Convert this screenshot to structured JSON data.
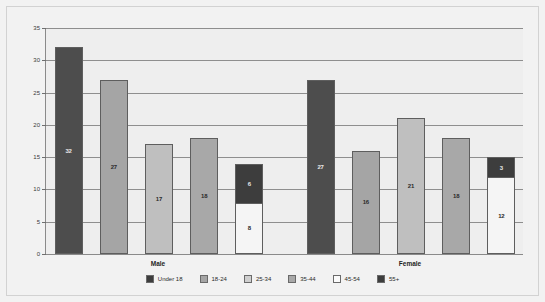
{
  "chart_data": {
    "type": "bar",
    "title": "",
    "subtitle": "",
    "xlabel": "",
    "ylabel": "",
    "grid": true,
    "legend_position": "bottom",
    "ylim": [
      0,
      35
    ],
    "yticks": [
      0,
      5,
      10,
      15,
      20,
      25,
      30,
      35
    ],
    "ytick_labels": [
      "0",
      "5",
      "10",
      "15",
      "20",
      "25",
      "30",
      "35"
    ],
    "categories": [
      "Male",
      "Female"
    ],
    "series": [
      {
        "name": "Under 18",
        "color": "#4d4d4d",
        "values": [
          32,
          27
        ]
      },
      {
        "name": "18-24",
        "color": "#a5a5a5",
        "values": [
          27,
          16
        ]
      },
      {
        "name": "25-34",
        "color": "#bfbfbf",
        "values": [
          17,
          21
        ]
      },
      {
        "name": "35-44",
        "color": "#a8a8a8",
        "values": [
          18,
          18
        ]
      },
      {
        "name": "45-54",
        "color": "#f5f5f5",
        "values": [
          8,
          12
        ]
      },
      {
        "name": "55+",
        "color": "#3d3d3d",
        "values": [
          6,
          3
        ]
      }
    ],
    "bars": [
      {
        "group": "Male",
        "index": 0,
        "segments": [
          {
            "series": "Under 18",
            "value": 32,
            "label": "32",
            "color": "#4d4d4d",
            "label_on": "dark"
          }
        ]
      },
      {
        "group": "Male",
        "index": 1,
        "segments": [
          {
            "series": "18-24",
            "value": 27,
            "label": "27",
            "color": "#a5a5a5",
            "label_on": "light"
          }
        ]
      },
      {
        "group": "Male",
        "index": 2,
        "segments": [
          {
            "series": "25-34",
            "value": 17,
            "label": "17",
            "color": "#bfbfbf",
            "label_on": "light"
          }
        ]
      },
      {
        "group": "Male",
        "index": 3,
        "segments": [
          {
            "series": "35-44",
            "value": 18,
            "label": "18",
            "color": "#a8a8a8",
            "label_on": "light"
          }
        ]
      },
      {
        "group": "Male",
        "index": 4,
        "segments": [
          {
            "series": "55+",
            "value": 6,
            "label": "6",
            "color": "#3d3d3d",
            "label_on": "dark"
          },
          {
            "series": "45-54",
            "value": 8,
            "label": "8",
            "color": "#f5f5f5",
            "label_on": "light"
          }
        ]
      },
      {
        "group": "Female",
        "index": 0,
        "segments": [
          {
            "series": "Under 18",
            "value": 27,
            "label": "27",
            "color": "#4d4d4d",
            "label_on": "dark"
          }
        ]
      },
      {
        "group": "Female",
        "index": 1,
        "segments": [
          {
            "series": "18-24",
            "value": 16,
            "label": "16",
            "color": "#a5a5a5",
            "label_on": "light"
          }
        ]
      },
      {
        "group": "Female",
        "index": 2,
        "segments": [
          {
            "series": "25-34",
            "value": 21,
            "label": "21",
            "color": "#bfbfbf",
            "label_on": "light"
          }
        ]
      },
      {
        "group": "Female",
        "index": 3,
        "segments": [
          {
            "series": "35-44",
            "value": 18,
            "label": "18",
            "color": "#a8a8a8",
            "label_on": "light"
          }
        ]
      },
      {
        "group": "Female",
        "index": 4,
        "segments": [
          {
            "series": "55+",
            "value": 3,
            "label": "3",
            "color": "#3d3d3d",
            "label_on": "dark"
          },
          {
            "series": "45-54",
            "value": 12,
            "label": "12",
            "color": "#f5f5f5",
            "label_on": "light"
          }
        ]
      }
    ],
    "legend": [
      {
        "label": "Under 18",
        "color": "#3d3d3d"
      },
      {
        "label": "18-24",
        "color": "#a5a5a5"
      },
      {
        "label": "25-34",
        "color": "#cfcfcf"
      },
      {
        "label": "35-44",
        "color": "#a8a8a8"
      },
      {
        "label": "45-54",
        "color": "#fbfbfb"
      },
      {
        "label": "55+",
        "color": "#3d3d3d"
      }
    ]
  },
  "colors": {
    "background": "#f2f2f2",
    "plot_background": "#eeeeee",
    "gridline": "#8e8e8e",
    "axis": "#8a8a8a",
    "frame": "#d2d2d2",
    "text": "#2b2b2b"
  }
}
